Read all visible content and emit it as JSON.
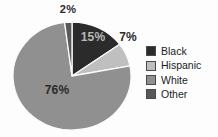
{
  "chart_data": {
    "type": "pie",
    "categories": [
      "Black",
      "Hispanic",
      "White",
      "Other"
    ],
    "values": [
      15,
      7,
      76,
      2
    ],
    "slice_labels": [
      "15%",
      "7%",
      "76%",
      "2%"
    ],
    "colors": [
      "#2b2b2b",
      "#bfbfbf",
      "#909090",
      "#585858"
    ],
    "start_angle_deg": 0,
    "direction": "clockwise",
    "legend": {
      "position": "right",
      "entries": [
        "Black",
        "Hispanic",
        "White",
        "Other"
      ]
    }
  }
}
